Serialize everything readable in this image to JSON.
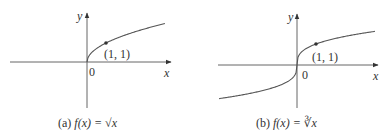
{
  "figures": [
    {
      "id": "a",
      "caption_prefix": "(a)",
      "caption_func": "f(x) = √x",
      "y_label": "y",
      "x_label": "x",
      "origin_label": "0",
      "point_label": "(1, 1)",
      "function": "sqrt"
    },
    {
      "id": "b",
      "caption_prefix": "(b)",
      "caption_func": "f(x) = ∛x",
      "y_label": "y",
      "x_label": "x",
      "origin_label": "0",
      "point_label": "(1, 1)",
      "function": "cbrt"
    }
  ],
  "colors": {
    "axis": "#555555",
    "curve": "#555555",
    "point": "#333333"
  }
}
